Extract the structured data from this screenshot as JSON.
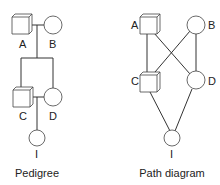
{
  "pedigree": {
    "caption": "Pedigree",
    "labels": {
      "A": "A",
      "B": "B",
      "C": "C",
      "D": "D",
      "I": "I"
    }
  },
  "path_diagram": {
    "caption": "Path diagram",
    "labels": {
      "A": "A",
      "B": "B",
      "C": "C",
      "D": "D",
      "I": "I"
    }
  },
  "colors": {
    "stroke": "#333333",
    "fill": "#ffffff",
    "shade": "#d8d8d8"
  }
}
